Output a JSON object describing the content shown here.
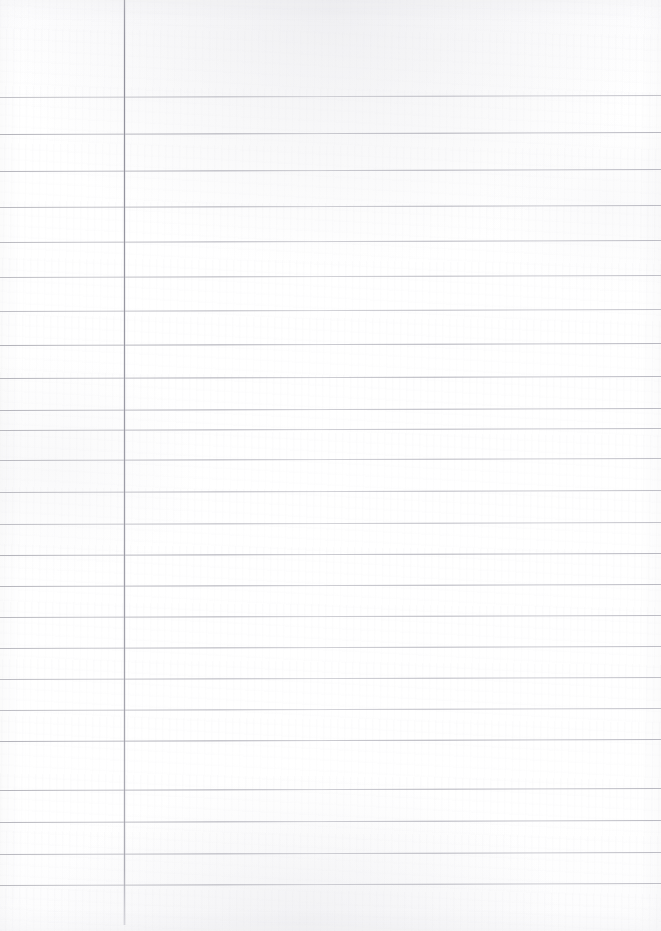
{
  "document": {
    "type": "scanned-ruled-paper",
    "title": "Blank ruled notebook page",
    "content_text": "",
    "page_width": 661,
    "page_height": 931,
    "paper_color": "#ffffff",
    "rule_color": "#a9a9b2",
    "margin_rule_color": "#94949f"
  },
  "margin_rule": {
    "name": "vertical-margin-line",
    "x": 124,
    "y_start": 0,
    "y_end": 925,
    "thickness": 1
  },
  "ruling": {
    "orientation": "horizontal",
    "count": 24,
    "full_bleed": true,
    "tilt_degrees": -0.18,
    "line_y_positions": [
      97,
      134,
      171,
      207,
      242,
      277,
      311,
      345,
      378,
      410,
      430,
      460,
      492,
      524,
      555,
      586,
      617,
      648,
      679,
      710,
      741,
      790,
      822,
      854,
      885
    ]
  },
  "annotations": {
    "handwriting": "none",
    "printed_text": "none",
    "figures": "none"
  }
}
